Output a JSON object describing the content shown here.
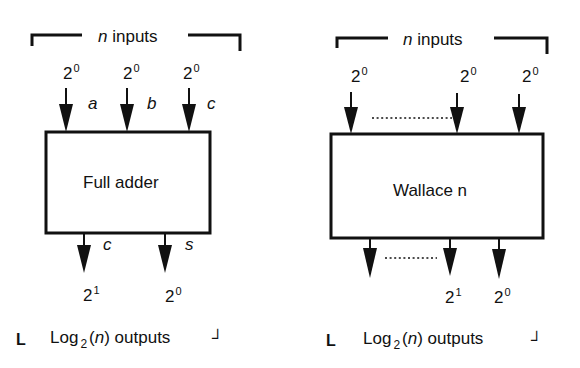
{
  "colors": {
    "ink": "#111111",
    "background": "#ffffff"
  },
  "left_diagram": {
    "block_label": "Full adder",
    "inputs_header": {
      "var": "n",
      "text": "inputs"
    },
    "inputs": [
      {
        "base": "2",
        "exp": "0",
        "name": "a"
      },
      {
        "base": "2",
        "exp": "0",
        "name": "b"
      },
      {
        "base": "2",
        "exp": "0",
        "name": "c"
      }
    ],
    "outputs": [
      {
        "base": "2",
        "exp": "1",
        "name": "c"
      },
      {
        "base": "2",
        "exp": "0",
        "name": "s"
      }
    ],
    "outputs_footer": {
      "prefix": "Log",
      "sub": "2",
      "paren_open": "(",
      "var": "n",
      "paren_close": ")",
      "text": "outputs"
    }
  },
  "right_diagram": {
    "block_label": "Wallace n",
    "inputs_header": {
      "var": "n",
      "text": "inputs"
    },
    "inputs": [
      {
        "base": "2",
        "exp": "0"
      },
      {
        "base": "2",
        "exp": "0"
      },
      {
        "base": "2",
        "exp": "0"
      }
    ],
    "outputs": [
      {
        "base": "2",
        "exp": "1"
      },
      {
        "base": "2",
        "exp": "0"
      }
    ],
    "outputs_footer": {
      "prefix": "Log",
      "sub": "2",
      "paren_open": "(",
      "var": "n",
      "paren_close": ")",
      "text": "outputs"
    }
  },
  "corners": {
    "left": "L",
    "right": "┘"
  }
}
